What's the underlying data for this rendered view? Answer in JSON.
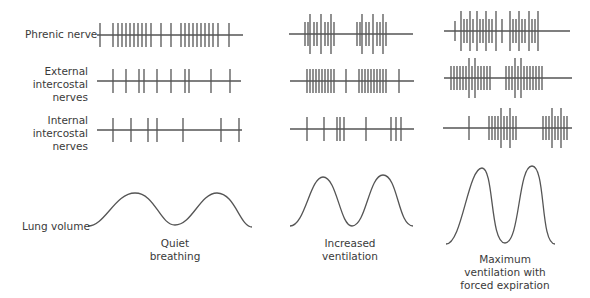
{
  "row_labels": {
    "phrenic": "Phrenic nerve",
    "external": [
      "External",
      "intercostal",
      "nerves"
    ],
    "internal": [
      "Internal",
      "intercostal",
      "nerves"
    ],
    "lung": "Lung volume"
  },
  "captions": {
    "quiet": [
      "Quiet",
      "breathing"
    ],
    "increased": [
      "Increased",
      "ventilation"
    ],
    "maximum": [
      "Maximum",
      "ventilation with",
      "forced expiration"
    ]
  },
  "colors": {
    "stroke": "#555555",
    "text": "#3a3a3a"
  },
  "columns": [
    {
      "name": "quiet-breathing",
      "rows": [
        {
          "y": 35,
          "x0": 97,
          "x1": 243,
          "spikes": [
            [
              100,
              12
            ],
            [
              113,
              12
            ],
            [
              118,
              12
            ],
            [
              122,
              12
            ],
            [
              126,
              12
            ],
            [
              130,
              12
            ],
            [
              134,
              12
            ],
            [
              138,
              12
            ],
            [
              142,
              12
            ],
            [
              146,
              12
            ],
            [
              151,
              12
            ],
            [
              161,
              12
            ],
            [
              171,
              12
            ],
            [
              181,
              12
            ],
            [
              185,
              12
            ],
            [
              189,
              12
            ],
            [
              193,
              12
            ],
            [
              197,
              12
            ],
            [
              201,
              12
            ],
            [
              205,
              12
            ],
            [
              209,
              12
            ],
            [
              213,
              12
            ],
            [
              218,
              12
            ],
            [
              229,
              12
            ]
          ]
        },
        {
          "y": 81,
          "x0": 97,
          "x1": 241,
          "spikes": [
            [
              113,
              12
            ],
            [
              126,
              12
            ],
            [
              139,
              12
            ],
            [
              144,
              12
            ],
            [
              157,
              12
            ],
            [
              171,
              12
            ],
            [
              185,
              12
            ],
            [
              189,
              12
            ],
            [
              211,
              12
            ],
            [
              230,
              12
            ]
          ]
        },
        {
          "y": 130,
          "x0": 97,
          "x1": 242,
          "spikes": [
            [
              113,
              12
            ],
            [
              131,
              12
            ],
            [
              148,
              12
            ],
            [
              157,
              12
            ],
            [
              183,
              12
            ],
            [
              221,
              12
            ],
            [
              239,
              12
            ]
          ]
        }
      ]
    },
    {
      "name": "increased-ventilation",
      "rows": [
        {
          "y": 34,
          "x0": 289,
          "x1": 413,
          "spikes": [
            [
              305,
              12
            ],
            [
              308,
              12
            ],
            [
              310,
              20
            ],
            [
              314,
              12
            ],
            [
              317,
              12
            ],
            [
              321,
              20
            ],
            [
              325,
              12
            ],
            [
              328,
              12
            ],
            [
              331,
              20
            ],
            [
              334,
              12
            ],
            [
              357,
              12
            ],
            [
              360,
              12
            ],
            [
              362,
              20
            ],
            [
              366,
              12
            ],
            [
              369,
              12
            ],
            [
              373,
              20
            ],
            [
              377,
              12
            ],
            [
              380,
              12
            ],
            [
              383,
              20
            ],
            [
              386,
              12
            ]
          ]
        },
        {
          "y": 81,
          "x0": 290,
          "x1": 414,
          "spikes": [
            [
              307,
              12
            ],
            [
              310,
              12
            ],
            [
              313,
              12
            ],
            [
              316,
              12
            ],
            [
              319,
              12
            ],
            [
              322,
              12
            ],
            [
              325,
              12
            ],
            [
              328,
              12
            ],
            [
              331,
              12
            ],
            [
              334,
              12
            ],
            [
              346,
              12
            ],
            [
              359,
              12
            ],
            [
              362,
              12
            ],
            [
              365,
              12
            ],
            [
              368,
              12
            ],
            [
              371,
              12
            ],
            [
              374,
              12
            ],
            [
              377,
              12
            ],
            [
              380,
              12
            ],
            [
              383,
              12
            ],
            [
              386,
              12
            ],
            [
              399,
              12
            ]
          ]
        },
        {
          "y": 129,
          "x0": 290,
          "x1": 414,
          "spikes": [
            [
              307,
              12
            ],
            [
              324,
              12
            ],
            [
              337,
              12
            ],
            [
              340,
              12
            ],
            [
              344,
              12
            ],
            [
              366,
              12
            ],
            [
              391,
              12
            ],
            [
              396,
              12
            ],
            [
              401,
              12
            ]
          ]
        }
      ]
    },
    {
      "name": "maximum-ventilation",
      "rows": [
        {
          "y": 31,
          "x0": 444,
          "x1": 570,
          "spikes": [
            [
              455,
              10
            ],
            [
              461,
              20
            ],
            [
              464,
              12
            ],
            [
              467,
              12
            ],
            [
              470,
              20
            ],
            [
              473,
              12
            ],
            [
              477,
              20
            ],
            [
              480,
              12
            ],
            [
              483,
              12
            ],
            [
              486,
              20
            ],
            [
              489,
              12
            ],
            [
              492,
              12
            ],
            [
              496,
              20
            ],
            [
              502,
              12
            ],
            [
              510,
              20
            ],
            [
              513,
              12
            ],
            [
              516,
              12
            ],
            [
              519,
              20
            ],
            [
              522,
              12
            ],
            [
              525,
              12
            ],
            [
              529,
              20
            ],
            [
              532,
              12
            ],
            [
              535,
              12
            ],
            [
              538,
              20
            ]
          ]
        },
        {
          "y": 78,
          "x0": 444,
          "x1": 572,
          "spikes": [
            [
              451,
              12
            ],
            [
              454,
              12
            ],
            [
              457,
              12
            ],
            [
              460,
              12
            ],
            [
              463,
              12
            ],
            [
              466,
              12
            ],
            [
              469,
              20
            ],
            [
              472,
              12
            ],
            [
              475,
              20
            ],
            [
              478,
              12
            ],
            [
              481,
              12
            ],
            [
              484,
              12
            ],
            [
              487,
              12
            ],
            [
              490,
              12
            ],
            [
              506,
              12
            ],
            [
              509,
              12
            ],
            [
              512,
              12
            ],
            [
              515,
              20
            ],
            [
              518,
              12
            ],
            [
              521,
              20
            ],
            [
              524,
              12
            ],
            [
              527,
              12
            ],
            [
              530,
              12
            ],
            [
              533,
              12
            ],
            [
              536,
              12
            ],
            [
              539,
              12
            ],
            [
              542,
              12
            ]
          ]
        },
        {
          "y": 128,
          "x0": 443,
          "x1": 572,
          "spikes": [
            [
              469,
              12
            ],
            [
              489,
              12
            ],
            [
              492,
              12
            ],
            [
              495,
              12
            ],
            [
              498,
              12
            ],
            [
              501,
              20
            ],
            [
              504,
              12
            ],
            [
              507,
              12
            ],
            [
              510,
              20
            ],
            [
              513,
              12
            ],
            [
              516,
              12
            ],
            [
              543,
              12
            ],
            [
              546,
              12
            ],
            [
              549,
              12
            ],
            [
              552,
              20
            ],
            [
              555,
              12
            ],
            [
              558,
              12
            ],
            [
              561,
              20
            ],
            [
              564,
              12
            ],
            [
              567,
              12
            ]
          ]
        }
      ]
    }
  ],
  "curves": [
    {
      "name": "quiet-breathing-volume",
      "d": "M 88 226 C 105 226, 115 193, 135 193 C 155 193, 160 225, 175 225 C 192 225, 200 193, 217 193 C 235 193, 240 227, 252 227"
    },
    {
      "name": "increased-ventilation-volume",
      "d": "M 290 226 C 305 226, 310 177, 323 177 C 337 177, 340 226, 352 226 C 366 226, 369 175, 383 175 C 398 175, 398 226, 413 226"
    },
    {
      "name": "maximum-ventilation-volume",
      "d": "M 446 244 C 462 244, 468 168, 482 168 C 494 168, 490 243, 505 243 C 520 243, 518 166, 532 166 C 546 166, 540 244, 555 244"
    }
  ]
}
